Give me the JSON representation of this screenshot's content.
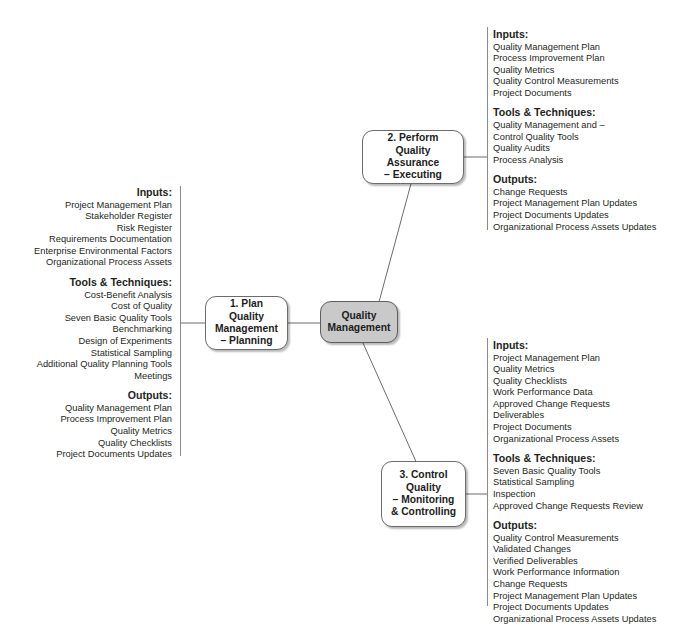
{
  "diagram": {
    "center_node": {
      "id": "center",
      "lines": [
        "Quality",
        "Management"
      ],
      "fill_color": "#c9c9c9"
    },
    "nodes": [
      {
        "id": "plan-quality-management",
        "lines": [
          "1. Plan Quality",
          "Management",
          "– Planning"
        ],
        "fill_color": "#ffffff"
      },
      {
        "id": "perform-quality-assurance",
        "lines": [
          "2. Perform Quality",
          "Assurance",
          "– Executing"
        ],
        "fill_color": "#ffffff"
      },
      {
        "id": "control-quality",
        "lines": [
          "3. Control",
          "Quality",
          "– Monitoring",
          "& Controlling"
        ],
        "fill_color": "#ffffff"
      }
    ],
    "panels": [
      {
        "id": "panel-plan-quality-management",
        "align": "right",
        "sections": [
          {
            "heading": "Inputs:",
            "items": [
              "Project Management Plan",
              "Stakeholder Register",
              "Risk Register",
              "Requirements Documentation",
              "Enterprise Environmental Factors",
              "Organizational Process Assets"
            ]
          },
          {
            "heading": "Tools & Techniques:",
            "items": [
              "Cost-Benefit Analysis",
              "Cost of Quality",
              "Seven Basic Quality Tools",
              "Benchmarking",
              "Design of Experiments",
              "Statistical Sampling",
              "Additional Quality Planning Tools",
              "Meetings"
            ]
          },
          {
            "heading": "Outputs:",
            "items": [
              "Quality Management Plan",
              "Process Improvement Plan",
              "Quality Metrics",
              "Quality Checklists",
              "Project Documents Updates"
            ]
          }
        ]
      },
      {
        "id": "panel-perform-quality-assurance",
        "align": "left",
        "sections": [
          {
            "heading": "Inputs:",
            "items": [
              "Quality Management Plan",
              "Process Improvement Plan",
              "Quality Metrics",
              "Quality Control Measurements",
              "Project Documents"
            ]
          },
          {
            "heading": "Tools & Techniques:",
            "items": [
              "Quality Management and –",
              "Control Quality Tools",
              "Quality Audits",
              "Process Analysis"
            ]
          },
          {
            "heading": "Outputs:",
            "items": [
              "Change Requests",
              "Project Management Plan Updates",
              "Project Documents Updates",
              "Organizational Process Assets Updates"
            ]
          }
        ]
      },
      {
        "id": "panel-control-quality",
        "align": "left",
        "sections": [
          {
            "heading": "Inputs:",
            "items": [
              "Project Management Plan",
              "Quality Metrics",
              "Quality Checklists",
              "Work Performance Data",
              "Approved Change Requests",
              "Deliverables",
              "Project Documents",
              "Organizational Process Assets"
            ]
          },
          {
            "heading": "Tools & Techniques:",
            "items": [
              "Seven Basic Quality Tools",
              "Statistical Sampling",
              "Inspection",
              "Approved Change Requests Review"
            ]
          },
          {
            "heading": "Outputs:",
            "items": [
              "Quality Control Measurements",
              "Validated Changes",
              "Verified Deliverables",
              "Work Performance Information",
              "Change Requests",
              "Project Management Plan Updates",
              "Project Documents Updates",
              "Organizational Process Assets Updates"
            ]
          }
        ]
      }
    ],
    "colors": {
      "line": "#6b6b6b",
      "rule": "#8a8a8a",
      "text": "#231f20",
      "center_fill": "#c9c9c9",
      "node_fill": "#ffffff"
    }
  }
}
